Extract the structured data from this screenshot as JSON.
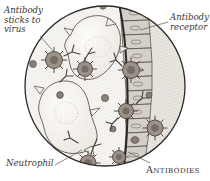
{
  "figure": {
    "shape": "circular-vignette",
    "background_color": "#ffffff",
    "outline_color": "#2e2a26"
  },
  "labels": {
    "antibody_sticks_to_virus": "Antibody\nsticks to\nvirus",
    "antibody_receptor": "Antibody\nreceptor",
    "neutrophil": "Neutrophil",
    "antibodies": "Antibodies"
  },
  "colors": {
    "ink": "#2e2a26",
    "cell_fill": "#f4f2ef",
    "cell_shade": "#dcd8d2",
    "virus_body": "#9b9189",
    "virus_core": "#7d736b",
    "particle": "#8a7f75",
    "wall_fill": "#cfcac3",
    "tissue_fill": "#e8e5e0",
    "label_text": "#3a3632"
  },
  "elements": {
    "neutrophils": [
      {
        "name": "neutrophil-upper",
        "cx": 97,
        "cy": 55
      },
      {
        "name": "neutrophil-lower",
        "cx": 70,
        "cy": 113
      }
    ],
    "viruses": [
      {
        "name": "virus-1",
        "cx": 54,
        "cy": 60,
        "r": 8.5
      },
      {
        "name": "virus-2",
        "cx": 85,
        "cy": 69,
        "r": 7.5
      },
      {
        "name": "virus-3",
        "cx": 131,
        "cy": 70,
        "r": 8.5
      },
      {
        "name": "virus-4",
        "cx": 126,
        "cy": 111,
        "r": 7.5
      },
      {
        "name": "virus-5",
        "cx": 155,
        "cy": 128,
        "r": 8.0
      },
      {
        "name": "virus-6",
        "cx": 88,
        "cy": 163,
        "r": 8.0
      },
      {
        "name": "virus-7",
        "cx": 119,
        "cy": 157,
        "r": 6.5
      }
    ],
    "free_particles": [
      {
        "cx": 33,
        "cy": 64,
        "r": 3.4
      },
      {
        "cx": 103,
        "cy": 6,
        "r": 3.2
      },
      {
        "cx": 60,
        "cy": 95,
        "r": 3.4
      },
      {
        "cx": 105,
        "cy": 98,
        "r": 3.6
      },
      {
        "cx": 135,
        "cy": 140,
        "r": 3.4
      },
      {
        "cx": 65,
        "cy": 160,
        "r": 3.4
      },
      {
        "cx": 113,
        "cy": 129,
        "r": 3.0
      },
      {
        "cx": 149,
        "cy": 95,
        "r": 3.0
      }
    ],
    "epithelial_wall": {
      "name": "epithelial-cell-column",
      "cell_count": 11
    },
    "leader_lines": [
      {
        "from": "antibody_sticks_to_virus",
        "to": "virus-1"
      },
      {
        "from": "antibody_receptor",
        "to": "epithelial-cell-column"
      },
      {
        "from": "neutrophil",
        "to": "neutrophil-lower"
      },
      {
        "from": "antibodies",
        "to": "virus-7"
      }
    ]
  }
}
